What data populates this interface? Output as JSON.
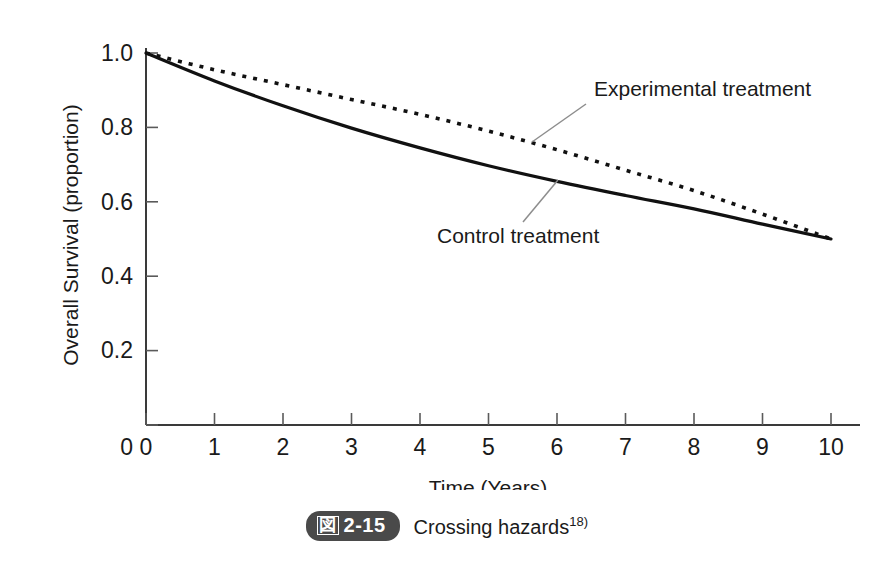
{
  "figure": {
    "badge_kanji": "図",
    "badge_number": "2-15",
    "caption": "Crossing hazards",
    "caption_superscript": "18)"
  },
  "chart_data": {
    "type": "line",
    "title": "",
    "xlabel": "Time (Years)",
    "ylabel": "Overall Survival (proportion)",
    "xlim": [
      0,
      10
    ],
    "ylim": [
      0,
      1.0
    ],
    "xticks": [
      0,
      1,
      2,
      3,
      4,
      5,
      6,
      7,
      8,
      9,
      10
    ],
    "xtick_labels": [
      "0",
      "1",
      "2",
      "3",
      "4",
      "5",
      "6",
      "7",
      "8",
      "9",
      "10"
    ],
    "yticks": [
      0,
      0.2,
      0.4,
      0.6,
      0.8,
      1.0
    ],
    "ytick_labels": [
      "0",
      "0.2",
      "0.4",
      "0.6",
      "0.8",
      "1.0"
    ],
    "grid": false,
    "legend_position": "inline-annotation",
    "x": [
      0,
      1,
      2,
      3,
      4,
      5,
      6,
      7,
      8,
      9,
      10
    ],
    "series": [
      {
        "name": "Experimental treatment",
        "style": "dotted",
        "color": "#111111",
        "values": [
          1.0,
          0.955,
          0.915,
          0.875,
          0.835,
          0.79,
          0.74,
          0.685,
          0.63,
          0.567,
          0.5
        ]
      },
      {
        "name": "Control treatment",
        "style": "solid",
        "color": "#111111",
        "values": [
          1.0,
          0.925,
          0.858,
          0.798,
          0.745,
          0.697,
          0.655,
          0.617,
          0.581,
          0.54,
          0.5
        ]
      }
    ],
    "annotations": [
      {
        "text": "Experimental treatment",
        "target_x": 5.6,
        "target_y": 0.77
      },
      {
        "text": "Control treatment",
        "target_x": 5.6,
        "target_y": 0.68
      }
    ]
  }
}
